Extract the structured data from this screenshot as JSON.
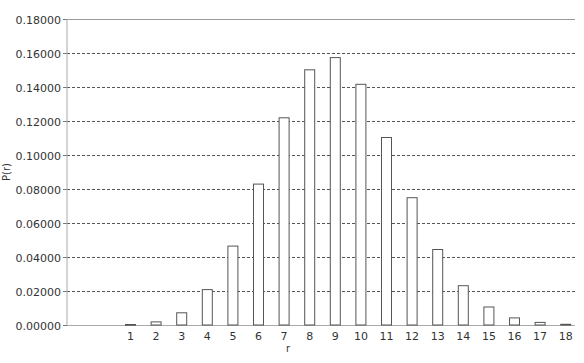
{
  "chart_data": {
    "type": "bar",
    "title": "",
    "xlabel": "r",
    "ylabel": "P(r)",
    "ylim": [
      0,
      0.18
    ],
    "yticks": [
      "0.00000",
      "0.02000",
      "0.04000",
      "0.06000",
      "0.08000",
      "0.10000",
      "0.12000",
      "0.14000",
      "0.16000",
      "0.18000"
    ],
    "grid": true,
    "legend": null,
    "categories": [
      "1",
      "2",
      "3",
      "4",
      "5",
      "6",
      "7",
      "8",
      "9",
      "10",
      "11",
      "12",
      "13",
      "14",
      "15",
      "16",
      "17",
      "18"
    ],
    "values": [
      0.0003,
      0.0018,
      0.0072,
      0.0208,
      0.0464,
      0.0829,
      0.1219,
      0.1501,
      0.1573,
      0.1416,
      0.1103,
      0.0749,
      0.0444,
      0.0231,
      0.0106,
      0.0042,
      0.0015,
      0.0004
    ]
  },
  "colors": {
    "bar_fill": "#ffffff",
    "bar_stroke": "#555555",
    "grid": "#555555",
    "axis": "#aaaaaa"
  }
}
